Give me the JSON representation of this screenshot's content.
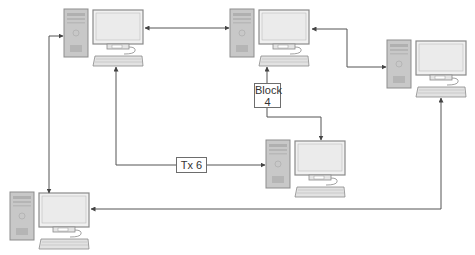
{
  "diagram": {
    "type": "peer-to-peer network",
    "nodes": [
      {
        "id": "pc-top-left",
        "x": 64,
        "y": 9
      },
      {
        "id": "pc-top-center",
        "x": 230,
        "y": 9
      },
      {
        "id": "pc-right",
        "x": 387,
        "y": 40
      },
      {
        "id": "pc-bottom-center",
        "x": 266,
        "y": 140
      },
      {
        "id": "pc-bottom-left",
        "x": 10,
        "y": 192
      }
    ],
    "labels": {
      "block": {
        "line1": "Block",
        "line2": "4"
      },
      "tx": "Tx 6"
    },
    "colors": {
      "line": "#555555",
      "tower_fill": "#c9c9c9",
      "screen_fill": "#ededed",
      "frame": "#8a8a8a"
    }
  }
}
